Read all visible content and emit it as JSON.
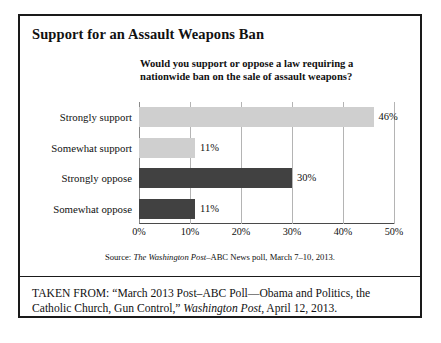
{
  "figure": {
    "title": "Support for an Assault Weapons Ban",
    "subtitle": "Would you support or oppose a law requiring a nationwide ban on the sale of assault weapons?",
    "source": {
      "prefix": "Source: ",
      "italic": "The Washington Post",
      "suffix": "–ABC News poll, March 7–10, 2013."
    },
    "taken_from": {
      "lead": "TAKEN FROM: “March 2013 Post–ABC Poll—Obama and Politics, the Catholic Church, Gun Control,” ",
      "italic": "Washington Post",
      "suffix": ", April 12, 2013."
    }
  },
  "colors": {
    "support_bar": "#cfcfcf",
    "oppose_bar": "#414141",
    "border": "#1a1a1a",
    "gridline": "#b4b4b4"
  },
  "chart_data": {
    "type": "bar",
    "orientation": "horizontal",
    "title": "Support for an Assault Weapons Ban",
    "subtitle": "Would you support or oppose a law requiring a nationwide ban on the sale of assault weapons?",
    "categories": [
      "Strongly support",
      "Somewhat support",
      "Strongly oppose",
      "Somewhat oppose"
    ],
    "values": [
      46,
      11,
      30,
      11
    ],
    "value_labels": [
      "46%",
      "11%",
      "30%",
      "11%"
    ],
    "bar_colors": [
      "#cfcfcf",
      "#cfcfcf",
      "#414141",
      "#414141"
    ],
    "xlabel": "",
    "ylabel": "",
    "xlim": [
      0,
      50
    ],
    "xticks": [
      0,
      10,
      20,
      30,
      40,
      50
    ],
    "xticklabels": [
      "0%",
      "10%",
      "20%",
      "30%",
      "40%",
      "50%"
    ],
    "grid": true,
    "grid_axis": "x",
    "legend": false,
    "units": "percent"
  }
}
